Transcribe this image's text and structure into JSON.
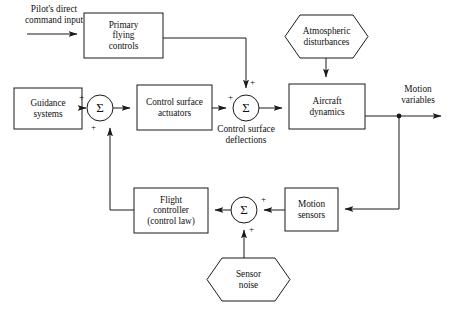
{
  "diagram": {
    "stroke_color": "#1a1a1a",
    "background_color": "#ffffff",
    "blocks": [
      {
        "id": "primary-flying-controls",
        "label": "Primary\nflying\ncontrols",
        "shape": "rect",
        "x": 84,
        "y": 13,
        "w": 79,
        "h": 45
      },
      {
        "id": "guidance-systems",
        "label": "Guidance\nsystems",
        "shape": "rect",
        "x": 14,
        "y": 88,
        "w": 68,
        "h": 41
      },
      {
        "id": "control-surface-actuators",
        "label": "Control surface\nactuators",
        "shape": "rect",
        "x": 137,
        "y": 85,
        "w": 75,
        "h": 45
      },
      {
        "id": "aircraft-dynamics",
        "label": "Aircraft\ndynamics",
        "shape": "rect",
        "x": 289,
        "y": 84,
        "w": 76,
        "h": 45
      },
      {
        "id": "flight-controller",
        "label": "Flight\ncontroller\n(control law)",
        "shape": "rect",
        "x": 134,
        "y": 188,
        "w": 74,
        "h": 45
      },
      {
        "id": "motion-sensors",
        "label": "Motion\nsensors",
        "shape": "rect",
        "x": 285,
        "y": 188,
        "w": 53,
        "h": 43
      },
      {
        "id": "atmospheric-disturbances",
        "label": "Atmospheric\ndisturbances",
        "shape": "hexagon",
        "x": 285,
        "y": 15,
        "w": 83,
        "h": 43
      },
      {
        "id": "sensor-noise",
        "label": "Sensor\nnoise",
        "shape": "hexagon",
        "x": 207,
        "y": 258,
        "w": 83,
        "h": 43
      }
    ],
    "summing_junctions": [
      {
        "id": "summer-guidance",
        "symbol": "Σ",
        "cx": 100,
        "cy": 108,
        "r": 13,
        "signs": [
          {
            "label": "+",
            "position": "left-top"
          },
          {
            "label": "+",
            "position": "bottom-left"
          }
        ]
      },
      {
        "id": "summer-control-surface",
        "symbol": "Σ",
        "cx": 246,
        "cy": 108,
        "r": 13,
        "signs": [
          {
            "label": "+",
            "position": "left-top"
          },
          {
            "label": "+",
            "position": "top-right"
          }
        ]
      },
      {
        "id": "summer-sensor",
        "symbol": "Σ",
        "cx": 244,
        "cy": 210,
        "r": 13,
        "signs": [
          {
            "label": "+",
            "position": "right-top"
          },
          {
            "label": "+",
            "position": "bottom-right"
          }
        ]
      }
    ],
    "free_labels": [
      {
        "id": "pilot-command-input",
        "text": "Pilot's direct\ncommand input",
        "x": 15,
        "y": 4,
        "w": 78
      },
      {
        "id": "control-surface-deflections",
        "text": "Control surface\ndeflections",
        "x": 205,
        "y": 124,
        "w": 82
      },
      {
        "id": "motion-variables",
        "text": "Motion\nvariables",
        "x": 393,
        "y": 84,
        "w": 50
      }
    ],
    "signal_paths": [
      {
        "id": "path-pilot-to-primary",
        "from": "pilot-command-input",
        "to": "primary-flying-controls"
      },
      {
        "id": "path-primary-to-summer-control-surface",
        "from": "primary-flying-controls",
        "to": "summer-control-surface"
      },
      {
        "id": "path-guidance-to-summer",
        "from": "guidance-systems",
        "to": "summer-guidance"
      },
      {
        "id": "path-summer-to-actuators",
        "from": "summer-guidance",
        "to": "control-surface-actuators"
      },
      {
        "id": "path-actuators-to-summer-control-surface",
        "from": "control-surface-actuators",
        "to": "summer-control-surface"
      },
      {
        "id": "path-atmospheric-to-aircraft",
        "from": "atmospheric-disturbances",
        "to": "aircraft-dynamics"
      },
      {
        "id": "path-summer-to-aircraft",
        "from": "summer-control-surface",
        "to": "aircraft-dynamics"
      },
      {
        "id": "path-aircraft-to-motion-variables",
        "from": "aircraft-dynamics",
        "to": "motion-variables"
      },
      {
        "id": "path-feedback-to-motion-sensors",
        "from": "motion-variables-node",
        "to": "motion-sensors"
      },
      {
        "id": "path-motion-sensors-to-summer-sensor",
        "from": "motion-sensors",
        "to": "summer-sensor"
      },
      {
        "id": "path-sensor-noise-to-summer-sensor",
        "from": "sensor-noise",
        "to": "summer-sensor"
      },
      {
        "id": "path-summer-sensor-to-flight-controller",
        "from": "summer-sensor",
        "to": "flight-controller"
      },
      {
        "id": "path-flight-controller-to-summer-guidance",
        "from": "flight-controller",
        "to": "summer-guidance"
      }
    ]
  }
}
